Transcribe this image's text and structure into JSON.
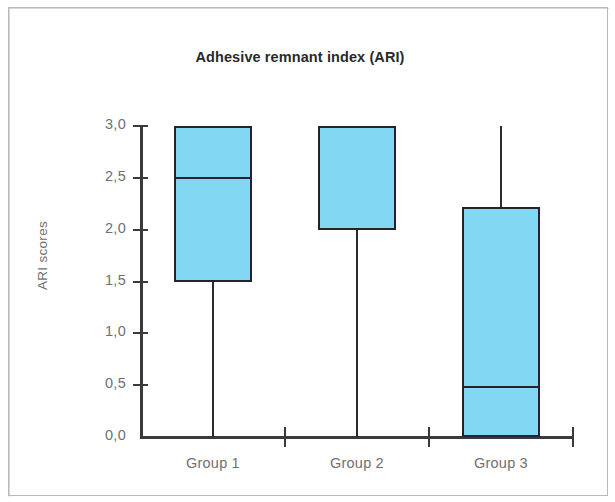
{
  "figure": {
    "title": "Adhesive remnant index (ARI)",
    "y_axis_title": "ARI scores",
    "box_fill_color": "#82d7f2",
    "line_color": "#23232b",
    "label_color": "#6f6f74",
    "background_color": "#ffffff"
  },
  "chart_data": {
    "type": "box",
    "title": "Adhesive remnant index (ARI)",
    "subtitle": "",
    "xlabel": "",
    "ylabel": "ARI scores",
    "ylim": [
      0.0,
      3.0
    ],
    "ytick_labels": [
      "0,0",
      "0,5",
      "1,0",
      "1,5",
      "2,0",
      "2,5",
      "3,0"
    ],
    "ytick_values": [
      0.0,
      0.5,
      1.0,
      1.5,
      2.0,
      2.5,
      3.0
    ],
    "decimal_separator": ",",
    "grid": false,
    "legend": "none",
    "categories": [
      "Group 1",
      "Group 2",
      "Group 3"
    ],
    "boxes": [
      {
        "name": "Group 1",
        "whisker_low": 0.0,
        "q1": 1.5,
        "median": 2.5,
        "q3": 3.0,
        "whisker_high": 3.0,
        "outliers": []
      },
      {
        "name": "Group 2",
        "whisker_low": 0.0,
        "q1": 2.0,
        "median": 3.0,
        "q3": 3.0,
        "whisker_high": 3.0,
        "outliers": []
      },
      {
        "name": "Group 3",
        "whisker_low": 0.0,
        "q1": 0.0,
        "median": 0.48,
        "q3": 2.22,
        "whisker_high": 3.0,
        "outliers": []
      }
    ]
  }
}
